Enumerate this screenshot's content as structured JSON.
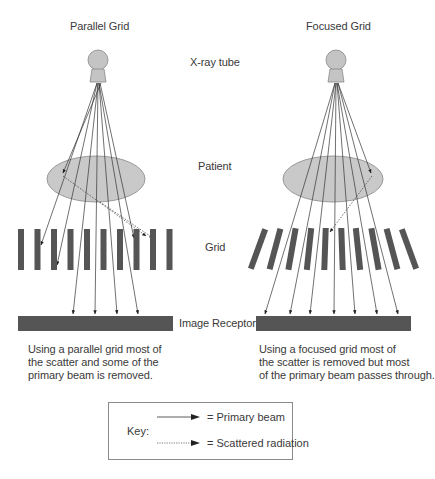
{
  "titles": {
    "left": "Parallel Grid",
    "right": "Focused Grid"
  },
  "center_labels": {
    "tube": "X-ray tube",
    "patient": "Patient",
    "grid": "Grid",
    "receptor": "Image Receptor"
  },
  "captions": {
    "left": [
      "Using a parallel grid most of",
      "the scatter and some of the",
      "primary beam is removed."
    ],
    "right": [
      "Using a focused grid most of",
      "the scatter is removed but most",
      "of the primary beam passes through."
    ]
  },
  "key": {
    "label": "Key:",
    "items": [
      {
        "line_style": "solid",
        "text": "= Primary beam"
      },
      {
        "line_style": "dotted",
        "text": "= Scattered radiation"
      }
    ]
  },
  "colors": {
    "tube_fill": "#c4c4c4",
    "patient_fill": "#c9c9c9",
    "grid_bar": "#555555",
    "receptor": "#555555",
    "beam_line": "#333333",
    "key_border": "#8a8a8a"
  },
  "diagram": {
    "left": {
      "type": "parallel",
      "grid_bar_count": 10,
      "primary_rays_reaching_receptor": 4,
      "scatter_rays": 2
    },
    "right": {
      "type": "focused",
      "grid_bar_count": 10,
      "primary_rays_reaching_receptor": 7,
      "scatter_rays": 1
    }
  }
}
